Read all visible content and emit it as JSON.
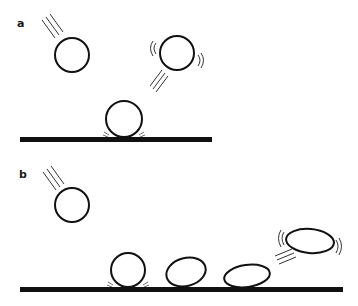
{
  "figure": {
    "panels": [
      {
        "label": "a",
        "description": "Rigid sphere: falls, contacts ground without deforming, rebounds while vibrating",
        "balls": [
          {
            "state": "falling",
            "shape": "circle"
          },
          {
            "state": "contact",
            "shape": "circle"
          },
          {
            "state": "rebounding-vibrating",
            "shape": "circle"
          }
        ]
      },
      {
        "label": "b",
        "description": "Deformable sphere: falls, contacts ground, progressively flattens and rebounds as vibrating ellipse",
        "balls": [
          {
            "state": "falling",
            "shape": "circle"
          },
          {
            "state": "contact",
            "shape": "circle"
          },
          {
            "state": "deforming",
            "shape": "ellipse"
          },
          {
            "state": "flattened",
            "shape": "ellipse"
          },
          {
            "state": "rebounding-vibrating",
            "shape": "ellipse"
          }
        ]
      }
    ],
    "colors": {
      "stroke": "#111111",
      "background": "#ffffff"
    }
  }
}
